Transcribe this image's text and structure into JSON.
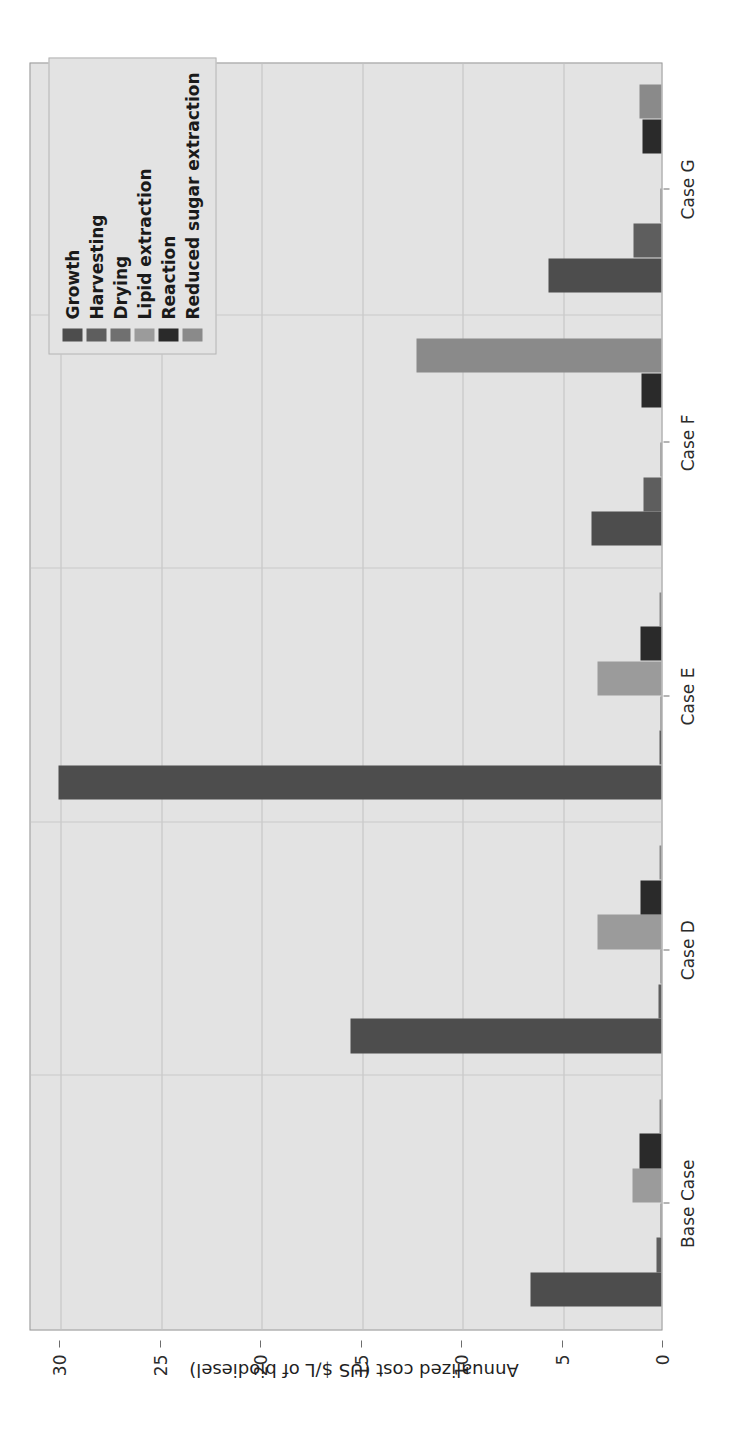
{
  "chart_data": {
    "type": "bar",
    "orientation": "grouped-vertical-rendered-rotated",
    "title": "",
    "xlabel": "",
    "ylabel": "Annualized cost (US $/L of biodiesel)",
    "categories": [
      "Base Case",
      "Case D",
      "Case E",
      "Case F",
      "Case G"
    ],
    "ylim": [
      0,
      31.5
    ],
    "yticks": [
      0,
      5,
      10,
      15,
      20,
      25,
      30
    ],
    "ytick_labels": [
      "0",
      "5",
      "10",
      "15",
      "20",
      "25",
      "30"
    ],
    "grid": true,
    "legend_position": "upper right",
    "series": [
      {
        "name": "Growth",
        "color": "#4d4d4d",
        "values": [
          6.5,
          15.5,
          30.0,
          3.5,
          5.6
        ]
      },
      {
        "name": "Harvesting",
        "color": "#5e5e5e",
        "values": [
          0.25,
          0.15,
          0.12,
          0.9,
          1.4
        ]
      },
      {
        "name": "Drying",
        "color": "#707070",
        "values": [
          0.05,
          0.05,
          0.05,
          0.05,
          0.05
        ]
      },
      {
        "name": "Lipid extraction",
        "color": "#9b9b9b",
        "values": [
          1.45,
          3.2,
          3.2,
          0.0,
          0.0
        ]
      },
      {
        "name": "Reaction",
        "color": "#2a2a2a",
        "values": [
          1.1,
          1.05,
          1.05,
          1.0,
          0.95
        ]
      },
      {
        "name": "Reduced sugar extraction",
        "color": "#8a8a8a",
        "values": [
          0.1,
          0.1,
          0.1,
          12.2,
          1.1
        ]
      }
    ]
  },
  "legend": {
    "items": [
      {
        "label": "Growth"
      },
      {
        "label": "Harvesting"
      },
      {
        "label": "Drying"
      },
      {
        "label": "Lipid extraction"
      },
      {
        "label": "Reaction"
      },
      {
        "label": "Reduced sugar extraction"
      }
    ]
  },
  "axes": {
    "value_axis_title": "Annualized cost (US $/L of biodiesel)"
  },
  "colors": {
    "plot_background": "#e3e3e3",
    "page_background": "#ffffff",
    "gridline": "#c4c4c4",
    "axis_text": "#2b2b2b"
  }
}
